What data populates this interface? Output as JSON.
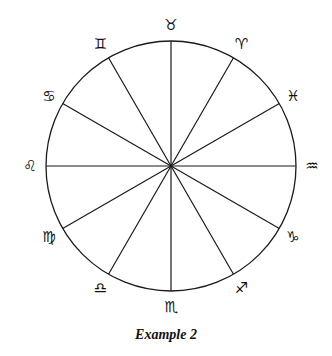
{
  "diagram": {
    "type": "zodiac-wheel",
    "center": [
      171,
      166
    ],
    "radius": 125,
    "stroke_color": "#1a1a1a",
    "spoke_count": 12,
    "caption": "Example 2",
    "signs": [
      {
        "name": "Taurus",
        "glyph": "♉",
        "angle_deg": 90
      },
      {
        "name": "Aries",
        "glyph": "♈",
        "angle_deg": 60
      },
      {
        "name": "Pisces",
        "glyph": "♓",
        "angle_deg": 30
      },
      {
        "name": "Aquarius",
        "glyph": "♒",
        "angle_deg": 0
      },
      {
        "name": "Capricorn",
        "glyph": "♑",
        "angle_deg": -30
      },
      {
        "name": "Sagittarius",
        "glyph": "♐",
        "angle_deg": -60
      },
      {
        "name": "Scorpio",
        "glyph": "♏",
        "angle_deg": -90
      },
      {
        "name": "Libra",
        "glyph": "♎",
        "angle_deg": -120
      },
      {
        "name": "Virgo",
        "glyph": "♍",
        "angle_deg": -150
      },
      {
        "name": "Leo",
        "glyph": "♌",
        "angle_deg": 180
      },
      {
        "name": "Cancer",
        "glyph": "♋",
        "angle_deg": 150
      },
      {
        "name": "Gemini",
        "glyph": "♊",
        "angle_deg": 120
      }
    ]
  }
}
